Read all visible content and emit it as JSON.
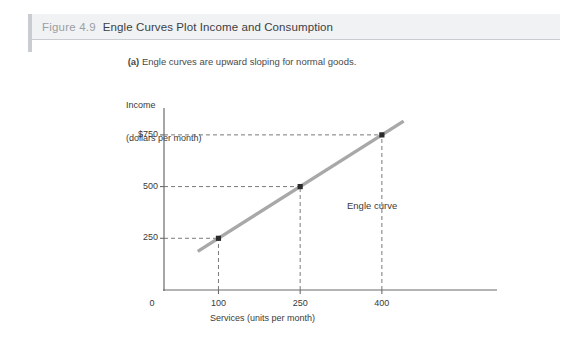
{
  "figure": {
    "number": "Figure 4.9",
    "title": "Engle Curves Plot Income and Consumption",
    "subtitle_prefix": "(a)",
    "subtitle_text": "Engle curves are upward sloping for normal goods."
  },
  "colors": {
    "header_background": "#f1f2f4",
    "header_border": "#c9ccd0",
    "spine": "#c9ccd0",
    "axis": "#6b6b6b",
    "curve": "#a8a8a8",
    "guide_dash": "#6b6b6b",
    "point": "#2b2b2b",
    "text": "#3a3a3a",
    "figure_number_text": "#9b9ea3"
  },
  "chart_data": {
    "type": "line",
    "title": "Engle Curves Plot Income and Consumption",
    "subtitle": "(a) Engle curves are upward sloping for normal goods.",
    "xlabel": "Services (units per month)",
    "ylabel_line1": "Income",
    "ylabel_line2": "(dollars per month)",
    "xlim": [
      0,
      470
    ],
    "ylim": [
      0,
      880
    ],
    "grid": false,
    "legend": "none",
    "origin_label": "0",
    "x_ticks": [
      100,
      250,
      400
    ],
    "x_tick_labels": [
      "100",
      "250",
      "400"
    ],
    "y_ticks": [
      250,
      500,
      750
    ],
    "y_tick_labels": [
      "250",
      "500",
      "$750"
    ],
    "series": [
      {
        "name": "Engle curve",
        "x": [
          100,
          250,
          400
        ],
        "y": [
          250,
          500,
          750
        ],
        "marker": "square",
        "color": "#a8a8a8",
        "line_extent_x": [
          62,
          440
        ],
        "annotation": "Engle curve"
      }
    ],
    "guides": [
      {
        "from": [
          0,
          250
        ],
        "to": [
          100,
          250
        ],
        "style": "dashed"
      },
      {
        "from": [
          100,
          0
        ],
        "to": [
          100,
          250
        ],
        "style": "dashed"
      },
      {
        "from": [
          0,
          500
        ],
        "to": [
          250,
          500
        ],
        "style": "dashed"
      },
      {
        "from": [
          250,
          0
        ],
        "to": [
          250,
          500
        ],
        "style": "dashed"
      },
      {
        "from": [
          0,
          750
        ],
        "to": [
          400,
          750
        ],
        "style": "dashed"
      },
      {
        "from": [
          400,
          0
        ],
        "to": [
          400,
          750
        ],
        "style": "dashed"
      }
    ]
  }
}
